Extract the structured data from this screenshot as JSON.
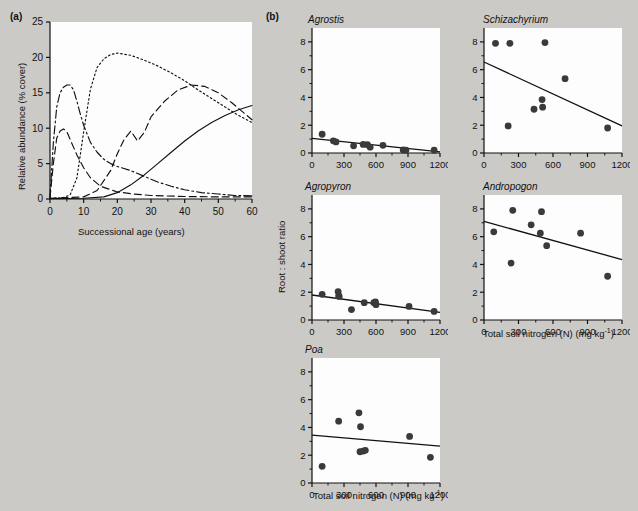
{
  "figure": {
    "background_color": "#cccac6",
    "panel_a_tag": "(a)",
    "panel_b_tag": "(b)"
  },
  "chart_data": [
    {
      "id": "successional-abundance",
      "type": "line",
      "title": "",
      "xlabel": "Successional age (years)",
      "ylabel": "Relative abundance (% cover)",
      "xlim": [
        0,
        60
      ],
      "ylim": [
        0,
        25
      ],
      "xticks": [
        0,
        10,
        20,
        30,
        40,
        50,
        60
      ],
      "yticks": [
        0,
        5,
        10,
        15,
        20,
        25
      ],
      "grid": false,
      "legend": "inline-annotations",
      "series": [
        {
          "name": "Agrostis scabra",
          "label": "Agrostis\nscabra",
          "style": "dashed",
          "points": [
            [
              0,
              0.2
            ],
            [
              1,
              5.0
            ],
            [
              2,
              8.6
            ],
            [
              3,
              9.6
            ],
            [
              4,
              9.9
            ],
            [
              5,
              9.5
            ],
            [
              6,
              8.4
            ],
            [
              8,
              6.2
            ],
            [
              10,
              4.4
            ],
            [
              12,
              3.0
            ],
            [
              15,
              1.8
            ],
            [
              20,
              1.0
            ],
            [
              25,
              0.7
            ],
            [
              30,
              0.5
            ],
            [
              40,
              0.35
            ],
            [
              50,
              0.3
            ],
            [
              60,
              0.3
            ]
          ]
        },
        {
          "name": "Agropyron repens",
          "label": "Agropyron\nrepens",
          "style": "dash-dot",
          "points": [
            [
              0,
              0.3
            ],
            [
              1,
              8.0
            ],
            [
              2,
              13.0
            ],
            [
              3,
              15.0
            ],
            [
              4,
              15.8
            ],
            [
              5,
              16.1
            ],
            [
              6,
              16.1
            ],
            [
              7,
              15.4
            ],
            [
              8,
              13.8
            ],
            [
              9,
              12.0
            ],
            [
              10,
              10.4
            ],
            [
              12,
              8.0
            ],
            [
              14,
              6.6
            ],
            [
              16,
              5.6
            ],
            [
              18,
              5.0
            ],
            [
              20,
              4.6
            ],
            [
              24,
              4.0
            ],
            [
              28,
              3.2
            ],
            [
              32,
              2.4
            ],
            [
              36,
              1.8
            ],
            [
              40,
              1.3
            ],
            [
              45,
              0.9
            ],
            [
              50,
              0.7
            ],
            [
              55,
              0.5
            ],
            [
              60,
              0.45
            ]
          ]
        },
        {
          "name": "Poa pratensis",
          "label": "Poa pratensis",
          "style": "dotted",
          "points": [
            [
              0,
              0.1
            ],
            [
              4,
              0.2
            ],
            [
              6,
              0.6
            ],
            [
              8,
              3.0
            ],
            [
              10,
              9.5
            ],
            [
              12,
              15.5
            ],
            [
              14,
              18.6
            ],
            [
              16,
              19.8
            ],
            [
              18,
              20.4
            ],
            [
              20,
              20.6
            ],
            [
              24,
              20.3
            ],
            [
              28,
              19.6
            ],
            [
              32,
              18.8
            ],
            [
              36,
              17.8
            ],
            [
              40,
              16.7
            ],
            [
              44,
              15.4
            ],
            [
              48,
              14.2
            ],
            [
              52,
              13.0
            ],
            [
              56,
              11.8
            ],
            [
              60,
              10.8
            ]
          ]
        },
        {
          "name": "Schizachyrium scoparium",
          "label": "Schizachyrium\nscoparium",
          "style": "dashed",
          "points": [
            [
              0,
              0.1
            ],
            [
              10,
              0.3
            ],
            [
              14,
              1.2
            ],
            [
              18,
              4.0
            ],
            [
              20,
              6.4
            ],
            [
              22,
              8.4
            ],
            [
              24,
              9.6
            ],
            [
              26,
              8.2
            ],
            [
              28,
              9.4
            ],
            [
              30,
              11.6
            ],
            [
              34,
              13.8
            ],
            [
              38,
              15.4
            ],
            [
              42,
              16.1
            ],
            [
              46,
              15.9
            ],
            [
              50,
              15.0
            ],
            [
              54,
              13.6
            ],
            [
              58,
              12.0
            ],
            [
              60,
              11.2
            ]
          ]
        },
        {
          "name": "Andropogon gerardi",
          "label": "Andropogon\ngerardi",
          "style": "solid",
          "points": [
            [
              0,
              0.05
            ],
            [
              10,
              0.1
            ],
            [
              16,
              0.3
            ],
            [
              20,
              0.9
            ],
            [
              24,
              2.0
            ],
            [
              28,
              3.4
            ],
            [
              32,
              5.0
            ],
            [
              36,
              6.6
            ],
            [
              40,
              8.2
            ],
            [
              44,
              9.6
            ],
            [
              48,
              10.8
            ],
            [
              52,
              11.8
            ],
            [
              56,
              12.6
            ],
            [
              60,
              13.2
            ]
          ]
        }
      ]
    },
    {
      "id": "agrostis-root-shoot",
      "type": "scatter",
      "title": "Agrostis",
      "xlabel": "",
      "ylabel": "Root : shoot ratio",
      "xlim": [
        0,
        1200
      ],
      "ylim": [
        0,
        9
      ],
      "xticks": [
        0,
        300,
        600,
        900,
        1200
      ],
      "yticks": [
        0,
        2,
        4,
        6,
        8
      ],
      "grid": false,
      "points": [
        [
          95,
          1.35
        ],
        [
          200,
          0.88
        ],
        [
          225,
          0.8
        ],
        [
          390,
          0.52
        ],
        [
          480,
          0.62
        ],
        [
          520,
          0.6
        ],
        [
          545,
          0.42
        ],
        [
          665,
          0.55
        ],
        [
          855,
          0.22
        ],
        [
          880,
          0.2
        ],
        [
          1145,
          0.2
        ]
      ],
      "fit_line": {
        "x": [
          0,
          1200
        ],
        "y": [
          1.05,
          0.08
        ]
      }
    },
    {
      "id": "schizachyrium-root-shoot",
      "type": "scatter",
      "title": "Schizachyrium",
      "xlabel": "",
      "ylabel": "",
      "xlim": [
        0,
        1200
      ],
      "ylim": [
        0,
        9
      ],
      "xticks": [
        0,
        300,
        600,
        900,
        1200
      ],
      "yticks": [
        0,
        2,
        4,
        6,
        8
      ],
      "grid": false,
      "points": [
        [
          100,
          7.9
        ],
        [
          225,
          7.9
        ],
        [
          210,
          1.95
        ],
        [
          435,
          3.15
        ],
        [
          505,
          3.85
        ],
        [
          510,
          3.3
        ],
        [
          530,
          7.95
        ],
        [
          705,
          5.35
        ],
        [
          1075,
          1.8
        ]
      ],
      "fit_line": {
        "x": [
          0,
          1200
        ],
        "y": [
          6.55,
          1.95
        ]
      }
    },
    {
      "id": "agropyron-root-shoot",
      "type": "scatter",
      "title": "Agropyron",
      "xlabel": "",
      "ylabel": "Root : shoot ratio",
      "xlim": [
        0,
        1200
      ],
      "ylim": [
        0,
        9
      ],
      "xticks": [
        0,
        300,
        600,
        900,
        1200
      ],
      "yticks": [
        0,
        2,
        4,
        6,
        8
      ],
      "grid": false,
      "points": [
        [
          95,
          1.85
        ],
        [
          245,
          2.05
        ],
        [
          250,
          1.75
        ],
        [
          255,
          1.7
        ],
        [
          370,
          0.75
        ],
        [
          490,
          1.25
        ],
        [
          580,
          1.25
        ],
        [
          595,
          1.3
        ],
        [
          600,
          1.1
        ],
        [
          910,
          0.98
        ],
        [
          1145,
          0.62
        ]
      ],
      "fit_line": {
        "x": [
          0,
          1200
        ],
        "y": [
          1.8,
          0.55
        ]
      }
    },
    {
      "id": "andropogon-root-shoot",
      "type": "scatter",
      "title": "Andropogon",
      "xlabel": "Total soil nitrogen (N)  (mg kg-1)",
      "ylabel": "",
      "xlim": [
        0,
        1200
      ],
      "ylim": [
        0,
        9
      ],
      "xticks": [
        0,
        300,
        600,
        900,
        1200
      ],
      "yticks": [
        0,
        2,
        4,
        6,
        8
      ],
      "grid": false,
      "points": [
        [
          85,
          6.35
        ],
        [
          235,
          4.1
        ],
        [
          250,
          7.9
        ],
        [
          410,
          6.85
        ],
        [
          490,
          6.25
        ],
        [
          500,
          7.8
        ],
        [
          545,
          5.35
        ],
        [
          840,
          6.25
        ],
        [
          1075,
          3.15
        ]
      ],
      "fit_line": {
        "x": [
          0,
          1200
        ],
        "y": [
          7.1,
          4.35
        ]
      }
    },
    {
      "id": "poa-root-shoot",
      "type": "scatter",
      "title": "Poa",
      "xlabel": "Total soil nitrogen (N)  (mg kg-1)",
      "ylabel": "Root : shoot ratio",
      "xlim": [
        0,
        1200
      ],
      "ylim": [
        0,
        9
      ],
      "xticks": [
        0,
        300,
        600,
        900,
        1200
      ],
      "yticks": [
        0,
        2,
        4,
        6,
        8
      ],
      "grid": false,
      "points": [
        [
          95,
          1.2
        ],
        [
          250,
          4.45
        ],
        [
          440,
          5.05
        ],
        [
          450,
          2.25
        ],
        [
          455,
          4.05
        ],
        [
          480,
          2.3
        ],
        [
          500,
          2.35
        ],
        [
          915,
          3.35
        ],
        [
          1110,
          1.85
        ]
      ],
      "fit_line": {
        "x": [
          0,
          1200
        ],
        "y": [
          3.45,
          2.65
        ]
      }
    }
  ],
  "labels": {
    "xlabel_successional": "Successional age (years)",
    "ylabel_abundance": "Relative abundance (% cover)",
    "ylabel_root_shoot": "Root : shoot ratio",
    "xlabel_nitrogen_main": "Total soil nitrogen (N)  (mg kg",
    "xlabel_nitrogen_sup": "-1",
    "xlabel_nitrogen_close": ")",
    "species": {
      "poa_pratensis": "Poa pratensis",
      "schizachyrium_line1": "Schizachyrium",
      "schizachyrium_line2": "scoparium",
      "agropyron_line1": "Agropyron",
      "agropyron_line2": "repens",
      "agrostis_line1": "Agrostis",
      "agrostis_line2": "scabra",
      "andropogon_line1": "Andropogon",
      "andropogon_line2": "gerardi"
    },
    "panel_titles": {
      "agrostis": "Agrostis",
      "schizachyrium": "Schizachyrium",
      "agropyron": "Agropyron",
      "andropogon": "Andropogon",
      "poa": "Poa"
    }
  }
}
